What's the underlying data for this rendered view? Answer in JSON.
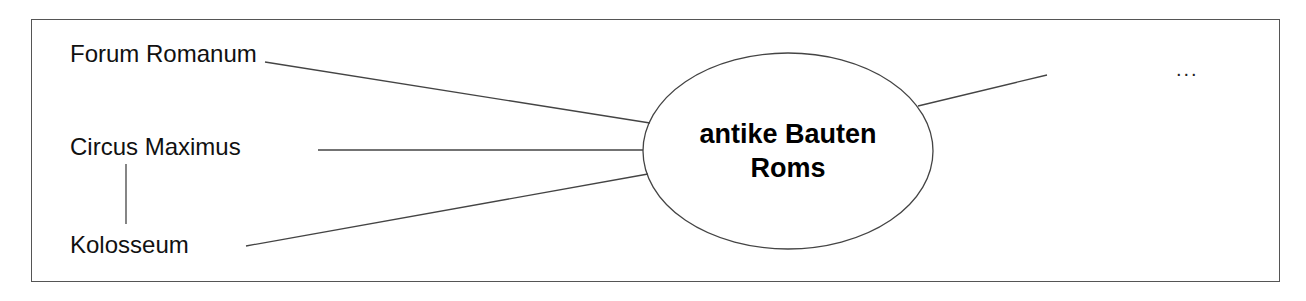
{
  "diagram": {
    "type": "mind-map",
    "center": {
      "line1": "antike Bauten",
      "line2": "Roms"
    },
    "nodes": [
      {
        "label": "Forum Romanum"
      },
      {
        "label": "Circus Maximus"
      },
      {
        "label": "Kolosseum"
      }
    ],
    "more": "..."
  }
}
